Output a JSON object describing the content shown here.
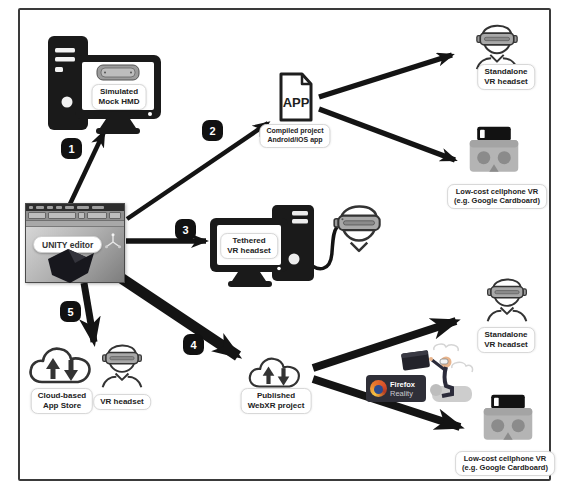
{
  "figure": {
    "description_not_shown": null
  },
  "steps": [
    {
      "num": "1"
    },
    {
      "num": "2"
    },
    {
      "num": "3"
    },
    {
      "num": "4"
    },
    {
      "num": "5"
    }
  ],
  "nodes": {
    "simulated_hmd": {
      "line1": "Simulated",
      "line2": "Mock HMD"
    },
    "compiled_app": {
      "file_text": "APP",
      "line1": "Compiled project",
      "line2": "Android/iOS app"
    },
    "standalone_top": {
      "line1": "Standalone",
      "line2": "VR headset"
    },
    "cardboard_top": {
      "line1": "Low-cost cellphone VR",
      "line2": "(e.g. Google Cardboard)"
    },
    "unity_editor": {
      "label": "UNITY editor"
    },
    "tethered": {
      "line1": "Tethered",
      "line2": "VR headset"
    },
    "cloud_store": {
      "line1": "Cloud-based",
      "line2": "App Store"
    },
    "vr_headset": {
      "label": "VR headset"
    },
    "webxr": {
      "line1": "Published",
      "line2": "WebXR project"
    },
    "firefox_reality": {
      "line1": "Firefox",
      "line2": "Reality"
    },
    "standalone_bottom": {
      "line1": "Standalone",
      "line2": "VR headset"
    },
    "cardboard_bottom": {
      "line1": "Low-cost cellphone VR",
      "line2": "(e.g. Google Cardboard)"
    }
  },
  "colors": {
    "ink": "#1a1a1a",
    "badge_bg": "#111111",
    "badge_text": "#ffffff",
    "headset_gray": "#a8a8a8",
    "cardboard_gray": "#b4b4b4",
    "firefox_badge_bg": "#2f2f38",
    "firefox_orange": "#e8762d",
    "firefox_blue": "#2c4b8f"
  }
}
